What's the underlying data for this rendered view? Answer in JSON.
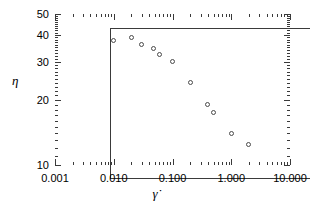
{
  "chart_data": {
    "type": "scatter",
    "title": "",
    "xlabel": "γ̇",
    "ylabel": "η",
    "xscale": "log",
    "yscale": "log",
    "xlim": [
      0.001,
      10.0
    ],
    "ylim": [
      10,
      50
    ],
    "grid": false,
    "legend": null,
    "xticklabels": [
      "0.001",
      "0.010",
      "0.100",
      "1.000",
      "10.000"
    ],
    "xtickvalues": [
      0.001,
      0.01,
      0.1,
      1.0,
      10.0
    ],
    "yticklabels": [
      "10",
      "20",
      "30",
      "40",
      "50"
    ],
    "ytickvalues": [
      10,
      20,
      30,
      40,
      50
    ],
    "marker": "open-circle",
    "marker_color": "#4a4a4a",
    "series": [
      {
        "name": "viscosity",
        "x": [
          0.01,
          0.02,
          0.03,
          0.048,
          0.06,
          0.1,
          0.2,
          0.4,
          0.5,
          1.0,
          2.0
        ],
        "y": [
          37.5,
          39.0,
          36.0,
          34.5,
          32.5,
          30.0,
          24.0,
          19.0,
          17.5,
          14.0,
          12.5
        ]
      }
    ]
  },
  "axes": {
    "x_title": "γ̇",
    "y_title": "η"
  }
}
